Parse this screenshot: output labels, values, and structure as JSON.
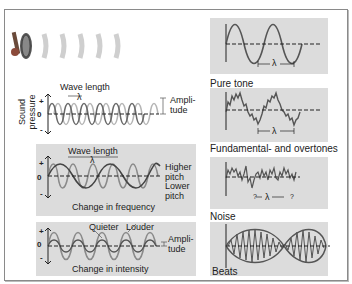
{
  "diagram": {
    "y_axis_label": [
      "Sound",
      "pressure"
    ],
    "axis_symbols": {
      "plus": "+",
      "zero": "0",
      "minus": "-"
    },
    "left": {
      "basic_wave": {
        "wavelength_label": "Wave length",
        "lambda": "λ",
        "amplitude_label": [
          "Ampli-",
          "tude"
        ]
      },
      "frequency_panel": {
        "wavelength_label": "Wave length",
        "lambda": "λ",
        "higher_label": [
          "Higher",
          "pitch"
        ],
        "lower_label": [
          "Lower",
          "pitch"
        ],
        "caption": "Change in frequency"
      },
      "intensity_panel": {
        "quieter_label": "Quieter",
        "louder_label": "Louder",
        "amplitude_label": [
          "Ampli-",
          "tude"
        ],
        "caption": "Change in intensity"
      }
    },
    "right": [
      {
        "caption": "Pure tone",
        "lambda": "λ"
      },
      {
        "caption": "Fundamental- and overtones",
        "lambda": "λ"
      },
      {
        "caption": "Noise",
        "lambda": "λ",
        "unknown": "?"
      },
      {
        "caption": "Beats"
      }
    ],
    "colors": {
      "panel_bg": "#dcdcdc",
      "dark_wave": "#6a6a6a",
      "light_wave": "#b5b5b5",
      "frame": "#8a8a8a"
    }
  }
}
